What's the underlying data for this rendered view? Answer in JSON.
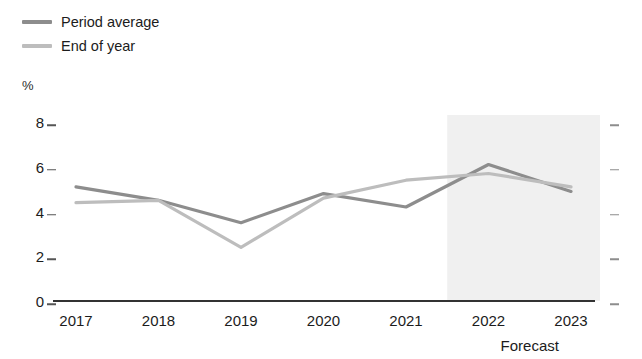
{
  "legend": {
    "position": "top-left",
    "items": [
      {
        "label": "Period average",
        "color": "#8d8d8d",
        "key": "period_average"
      },
      {
        "label": "End of year",
        "color": "#bdbdbd",
        "key": "end_of_year"
      }
    ]
  },
  "axes": {
    "y_unit": "%",
    "y_ticks": [
      "0",
      "2",
      "4",
      "6",
      "8"
    ],
    "x_ticks": [
      "2017",
      "2018",
      "2019",
      "2020",
      "2021",
      "2022",
      "2023"
    ]
  },
  "annotations": {
    "forecast_label": "Forecast"
  },
  "colors": {
    "period_average": "#8d8d8d",
    "end_of_year": "#bdbdbd",
    "axis": "#333333",
    "tick_left": "#555555",
    "tick_right": "#8d8d8d",
    "forecast_band": "#f0f0f0",
    "text": "#1c1c1c"
  },
  "chart_data": {
    "type": "line",
    "title": "",
    "subtitle": "",
    "xlabel": "",
    "ylabel": "%",
    "x": [
      "2017",
      "2018",
      "2019",
      "2020",
      "2021",
      "2022",
      "2023"
    ],
    "ylim": [
      0,
      8
    ],
    "xlim": [
      "2017",
      "2023"
    ],
    "ytick_values": [
      0,
      2,
      4,
      6,
      8
    ],
    "grid": false,
    "legend_position": "top-left",
    "series": [
      {
        "name": "Period average",
        "color": "#8d8d8d",
        "values": [
          5.1,
          4.5,
          3.5,
          4.8,
          4.2,
          6.1,
          4.9
        ]
      },
      {
        "name": "End of year",
        "color": "#bdbdbd",
        "values": [
          4.4,
          4.5,
          2.4,
          4.6,
          5.4,
          5.7,
          5.1
        ]
      }
    ],
    "annotations": [
      {
        "type": "shaded-band",
        "label": "Forecast",
        "x_start": "2021.5",
        "x_end": "2023.4",
        "color": "#f0f0f0"
      }
    ]
  }
}
